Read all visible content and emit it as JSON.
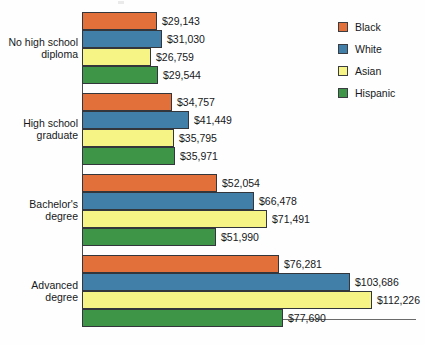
{
  "legend": {
    "position": "top-right",
    "items": [
      {
        "label": "Black",
        "color": "#e2703a"
      },
      {
        "label": "White",
        "color": "#417fa8"
      },
      {
        "label": "Asian",
        "color": "#f7f486"
      },
      {
        "label": "Hispanic",
        "color": "#3e9447"
      }
    ]
  },
  "chart_data": {
    "type": "bar",
    "orientation": "horizontal",
    "title": "",
    "subtitle": "",
    "xlabel": "",
    "ylabel": "",
    "grid": false,
    "legend_position": "top-right",
    "xlim": [
      0,
      112226
    ],
    "value_prefix": "$",
    "categories": [
      "No high school diploma",
      "High school graduate",
      "Bachelor's degree",
      "Advanced degree"
    ],
    "category_lines": [
      [
        "No high school",
        "diploma"
      ],
      [
        "High school",
        "graduate"
      ],
      [
        "Bachelor's",
        "degree"
      ],
      [
        "Advanced",
        "degree"
      ]
    ],
    "series": [
      {
        "name": "Black",
        "color": "#e2703a",
        "values": [
          29143,
          34757,
          52054,
          76281
        ]
      },
      {
        "name": "White",
        "color": "#417fa8",
        "values": [
          31030,
          41449,
          66478,
          103686
        ]
      },
      {
        "name": "Asian",
        "color": "#f7f486",
        "values": [
          26759,
          35795,
          71491,
          112226
        ]
      },
      {
        "name": "Hispanic",
        "color": "#3e9447",
        "values": [
          29544,
          35971,
          51990,
          77690
        ]
      }
    ],
    "value_labels": [
      [
        "$29,143",
        "$31,030",
        "$26,759",
        "$29,544"
      ],
      [
        "$34,757",
        "$41,449",
        "$35,795",
        "$35,971"
      ],
      [
        "$52,054",
        "$66,478",
        "$71,491",
        "$51,990"
      ],
      [
        "$76,281",
        "$103,686",
        "$112,226",
        "$77,690"
      ]
    ]
  }
}
